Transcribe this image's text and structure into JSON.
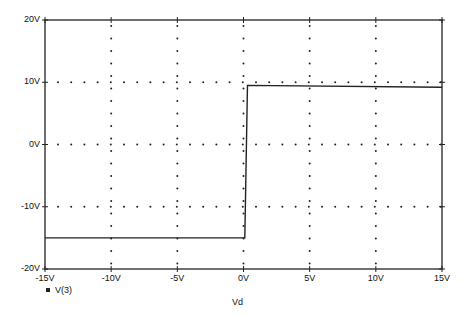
{
  "chart_data": {
    "type": "line",
    "title": "",
    "xlabel": "Vd",
    "ylabel": "",
    "xlim": [
      -15,
      15
    ],
    "ylim": [
      -20,
      20
    ],
    "x_ticks": [
      "-15V",
      "-10V",
      "-5V",
      "0V",
      "5V",
      "10V",
      "15V"
    ],
    "y_ticks": [
      "20V",
      "10V",
      "0V",
      "-10V",
      "-20V"
    ],
    "grid": "dotted",
    "legend": {
      "position": "bottom-left",
      "entries": [
        "V(3)"
      ]
    },
    "series": [
      {
        "name": "V(3)",
        "x": [
          -15,
          0,
          0.1,
          0.3,
          15
        ],
        "y": [
          -15,
          -15,
          -15,
          9.5,
          9.2
        ]
      }
    ]
  },
  "legend_label": "V(3)",
  "xlabel": "Vd",
  "x_ticks": [
    "-15V",
    "-10V",
    "-5V",
    "0V",
    "5V",
    "10V",
    "15V"
  ],
  "y_ticks": [
    "20V",
    "10V",
    "0V",
    "-10V",
    "-20V"
  ]
}
